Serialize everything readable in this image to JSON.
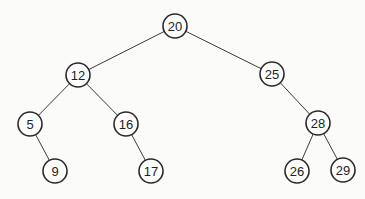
{
  "diagram": {
    "type": "binary-search-tree",
    "colors": {
      "background": "#fbfbfa",
      "node_fill": "#ffffff",
      "node_stroke": "#2a2a2a",
      "edge": "#3a3a3a",
      "text": "#222222"
    },
    "node_radius": 12,
    "nodes": [
      {
        "id": "n20",
        "label": "20",
        "x": 175,
        "y": 26
      },
      {
        "id": "n12",
        "label": "12",
        "x": 78,
        "y": 75
      },
      {
        "id": "n25",
        "label": "25",
        "x": 272,
        "y": 74
      },
      {
        "id": "n5",
        "label": "5",
        "x": 30,
        "y": 124
      },
      {
        "id": "n16",
        "label": "16",
        "x": 126,
        "y": 124
      },
      {
        "id": "n28",
        "label": "28",
        "x": 318,
        "y": 123
      },
      {
        "id": "n9",
        "label": "9",
        "x": 55,
        "y": 171
      },
      {
        "id": "n17",
        "label": "17",
        "x": 151,
        "y": 171
      },
      {
        "id": "n26",
        "label": "26",
        "x": 297,
        "y": 171
      },
      {
        "id": "n29",
        "label": "29",
        "x": 343,
        "y": 170
      }
    ],
    "edges": [
      {
        "from": "n20",
        "to": "n12"
      },
      {
        "from": "n20",
        "to": "n25"
      },
      {
        "from": "n12",
        "to": "n5"
      },
      {
        "from": "n12",
        "to": "n16"
      },
      {
        "from": "n25",
        "to": "n28"
      },
      {
        "from": "n5",
        "to": "n9"
      },
      {
        "from": "n16",
        "to": "n17"
      },
      {
        "from": "n28",
        "to": "n26"
      },
      {
        "from": "n28",
        "to": "n29"
      }
    ]
  }
}
